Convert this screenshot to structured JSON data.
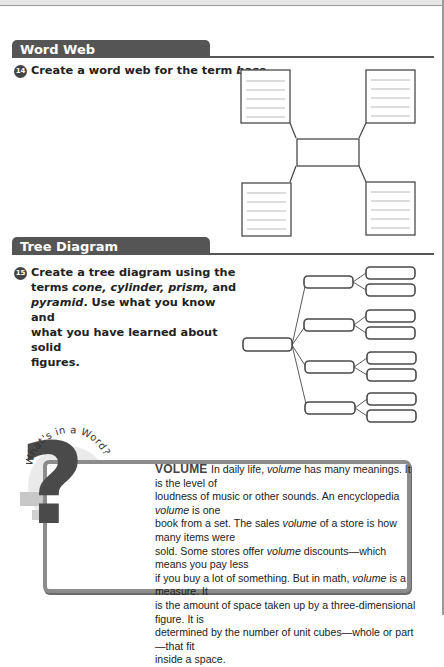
{
  "word_web": {
    "section_title": "Word Web",
    "question_number": "14",
    "question_text_prefix": "Create a word web for the term ",
    "question_term": "base",
    "question_text_suffix": ".",
    "boxes": [
      "top-left",
      "top-right",
      "center",
      "bottom-left",
      "bottom-right"
    ],
    "lines_per_box": 5
  },
  "tree_diagram": {
    "section_title": "Tree Diagram",
    "question_number": "15",
    "question_lines": {
      "l1": "Create a tree diagram using the",
      "l2_prefix": "terms ",
      "l2_terms": "cone, cylinder, prism,",
      "l2_suffix": " and",
      "l3_term": "pyramid",
      "l3_suffix": ". Use what you know and",
      "l4": "what you have learned about solid",
      "l5": "figures."
    },
    "levels": {
      "root": 1,
      "branches": 4,
      "leaves_per_branch": 2
    }
  },
  "whats_in_a_word": {
    "label": "What's in a Word?",
    "icon": "question-mark-icon",
    "term": "VOLUME",
    "lines": [
      [
        "In daily life, ",
        {
          "i": "volume"
        },
        " has many meanings. It is the level of"
      ],
      [
        "loudness of music or other sounds. An encyclopedia ",
        {
          "i": "volume"
        },
        " is one"
      ],
      [
        "book from a set. The sales ",
        {
          "i": "volume"
        },
        " of a store is how many items were"
      ],
      [
        "sold. Some stores offer ",
        {
          "i": "volume"
        },
        " discounts—which means you pay less"
      ],
      [
        "if you buy a lot of something. But in math, ",
        {
          "i": "volume"
        },
        " is a measure. It"
      ],
      [
        "is the amount of space taken up by a three-dimensional figure. It is"
      ],
      [
        "determined by the number of unit cubes—whole or part—that fit"
      ],
      [
        "inside a space."
      ]
    ]
  },
  "colors": {
    "header": "#555555",
    "box_border": "#4a4a4a",
    "frame": "#8c8c8c"
  }
}
